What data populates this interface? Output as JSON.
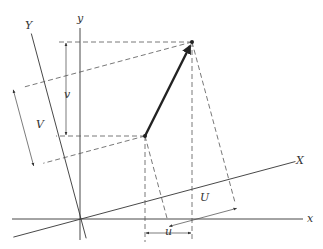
{
  "figure": {
    "type": "coordinate-rotation-diagram",
    "labels": {
      "x_axis": "x",
      "y_axis": "y",
      "X_axis": "X",
      "Y_axis": "Y",
      "u_component": "u",
      "v_component": "v",
      "U_component": "U",
      "V_component": "V"
    },
    "rotation_angle_deg": 15,
    "colors": {
      "line": "#333333",
      "vector": "#222222",
      "background": "#ffffff"
    }
  }
}
